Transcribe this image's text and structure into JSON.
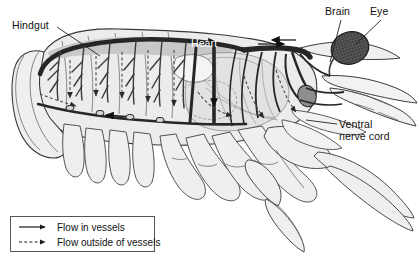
{
  "figure": {
    "width": 419,
    "height": 271,
    "background_color": "#ffffff",
    "ink_color": "#111111",
    "body_fill": "#e9e9e9",
    "shade_fill": "#c9c9c9",
    "vessel_color": "#2b2b2b"
  },
  "labels": [
    {
      "id": "hindgut",
      "text": "Hindgut",
      "color": "#111111"
    },
    {
      "id": "heart",
      "text": "Heart",
      "color": "#ffffff"
    },
    {
      "id": "brain",
      "text": "Brain",
      "color": "#111111"
    },
    {
      "id": "eye",
      "text": "Eye",
      "color": "#111111"
    },
    {
      "id": "ventral",
      "text": "Ventral",
      "color": "#111111"
    },
    {
      "id": "ventral2",
      "text": "nerve cord",
      "color": "#111111"
    }
  ],
  "legend": {
    "border_color": "#58585a",
    "items": [
      {
        "icon": "solid-arrow-icon",
        "label": "Flow in vessels",
        "style": "solid"
      },
      {
        "icon": "dashed-arrow-icon",
        "label": "Flow outside of vessels",
        "style": "dashed"
      }
    ]
  },
  "anatomy": {
    "structures": [
      "hindgut",
      "heart",
      "dorsal-abdominal-artery",
      "sternal-artery",
      "ventral-nerve-cord",
      "brain",
      "compound-eye",
      "cheliped",
      "walking-legs",
      "swimmerets",
      "tail-fan",
      "gills",
      "antennae"
    ]
  }
}
